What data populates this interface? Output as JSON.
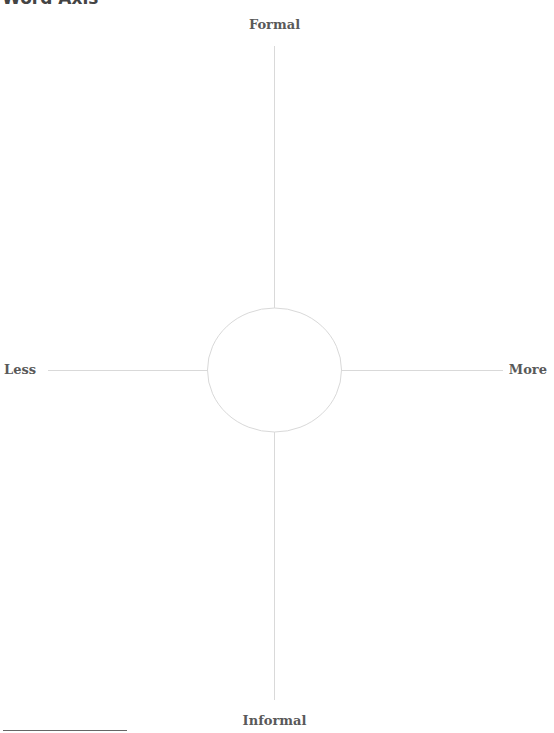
{
  "title": "Word Axis",
  "axes": {
    "top_label": "Formal",
    "bottom_label": "Informal",
    "left_label": "Less",
    "right_label": "More"
  },
  "center_circle": {
    "cx": 274.5,
    "cy": 370,
    "rx": 67,
    "ry": 62
  },
  "colors": {
    "axis_line": "#d9d9d9",
    "circle_stroke": "#d9d9d9",
    "label_text": "#595959"
  }
}
